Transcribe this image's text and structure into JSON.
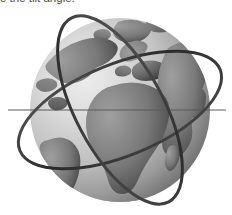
{
  "document": {
    "background_color": "#ffffff",
    "width": 232,
    "height": 215
  },
  "caption": {
    "text": "e the tilt angle.",
    "color": "#4a4a4a",
    "clipped": "true"
  },
  "figure": {
    "name": "globe-with-orbital-rings",
    "style": "grayscale"
  },
  "globe": {
    "center_x": 120,
    "center_y": 110,
    "radius_x": 90,
    "radius_y": 92,
    "ocean_light_color": "#d6d6d6",
    "ocean_mid_color": "#a8a8a8",
    "ocean_dark_color": "#3c3c3c",
    "land_light_color": "#8a8a8a",
    "land_mid_color": "#6e6e6e",
    "land_dark_color": "#2e2e2e",
    "terminator_side": "right",
    "highlight_x": 78,
    "highlight_y": 72
  },
  "equator": {
    "label": "equator-line",
    "color": "#5a5a5a",
    "y": 110,
    "x_start": 8,
    "x_end": 226,
    "width": 1
  },
  "rings": [
    {
      "label": "orbit-ring-1",
      "tilt_deg": -22,
      "radius_x": 108,
      "radius_y": 46,
      "stroke": "#2f2f2f",
      "stroke_width": 3
    },
    {
      "label": "orbit-ring-2",
      "tilt_deg": 62,
      "radius_x": 104,
      "radius_y": 44,
      "stroke": "#2f2f2f",
      "stroke_width": 3
    }
  ],
  "landmasses": [
    {
      "name": "greenland",
      "tone": "#9a9a9a"
    },
    {
      "name": "north-america",
      "tone": "#8e8e8e"
    },
    {
      "name": "south-america",
      "tone": "#707070"
    },
    {
      "name": "europe",
      "tone": "#7a7a7a"
    },
    {
      "name": "africa",
      "tone": "#6e6e6e"
    },
    {
      "name": "asia",
      "tone": "#3a3a3a"
    },
    {
      "name": "antarctica-rim",
      "tone": "#5a5a5a"
    }
  ]
}
